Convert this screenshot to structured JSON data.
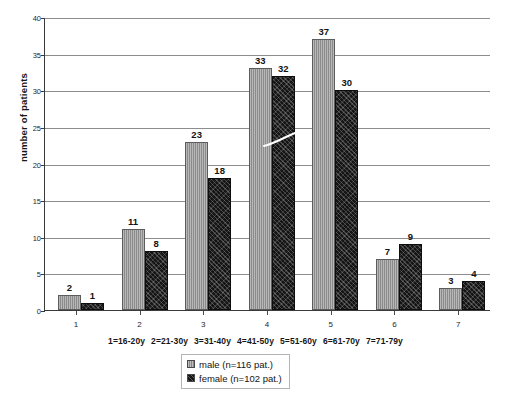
{
  "chart_data": {
    "type": "bar",
    "title": "",
    "xlabel": "",
    "ylabel": "number of patients",
    "ylim": [
      0,
      40
    ],
    "ytick_step": 5,
    "yticks": [
      "0",
      "5",
      "10",
      "15",
      "20",
      "25",
      "30",
      "35",
      "40"
    ],
    "grid": "horizontal",
    "legend_position": "bottom-center",
    "categories": [
      "1",
      "2",
      "3",
      "4",
      "5",
      "6",
      "7"
    ],
    "category_descriptions": [
      "1=16-20y",
      "2=21-30y",
      "3=31-40y",
      "4=41-50y",
      "5=51-60y",
      "6=61-70y",
      "7=71-79y"
    ],
    "series": [
      {
        "name": "male (n=116 pat.)",
        "short_name": "male",
        "total": 116,
        "color": "#9a9a9a",
        "values": [
          2,
          11,
          23,
          33,
          37,
          7,
          3
        ]
      },
      {
        "name": "female (n=102 pat.)",
        "short_name": "female",
        "total": 102,
        "color": "#151515",
        "values": [
          1,
          8,
          18,
          32,
          30,
          9,
          4
        ]
      }
    ],
    "annotations": [
      "white scratch artifact across group 4 female bar"
    ]
  },
  "legend": {
    "entries": [
      {
        "label": "male (n=116 pat.)",
        "swatch": "male-swatch-icon"
      },
      {
        "label": "female (n=102 pat.)",
        "swatch": "female-swatch-icon"
      }
    ]
  }
}
